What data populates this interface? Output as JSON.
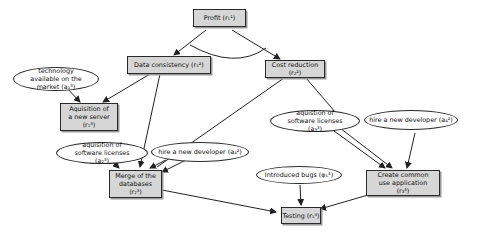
{
  "diagram": {
    "goals": {
      "profit": "Profit (r₁¹)",
      "data_consistency": "Data consistency (r₁²)",
      "cost_reduction": "Cost reduction (r₂²)",
      "new_server": "Aquisition of a new server (r₁³)",
      "merge_databases": "Merge of the databases (r₂³)",
      "common_app": "Create common use application (r₃³)",
      "testing": "Testing (r₁⁴)"
    },
    "conditions": {
      "technology": "technology available on the market (a₁³)",
      "licenses_left": "aquisition of software licenses (a₂³)",
      "developer_left": "hire a new developer (a₄²)",
      "licenses_right": "aquistion of software licenses (a₃³)",
      "developer_right": "hire a new developer (a₄²)",
      "bugs": "Introduced bugs (φ₁⁴)"
    },
    "edges": [
      {
        "from": "profit",
        "to": "data_consistency"
      },
      {
        "from": "profit",
        "to": "cost_reduction"
      },
      {
        "from": "data_consistency",
        "to": "new_server"
      },
      {
        "from": "data_consistency",
        "to": "merge_databases"
      },
      {
        "from": "technology",
        "to": "new_server"
      },
      {
        "from": "cost_reduction",
        "to": "merge_databases"
      },
      {
        "from": "cost_reduction",
        "to": "common_app"
      },
      {
        "from": "licenses_left",
        "to": "merge_databases"
      },
      {
        "from": "developer_left",
        "to": "merge_databases"
      },
      {
        "from": "licenses_right",
        "to": "common_app"
      },
      {
        "from": "developer_right",
        "to": "common_app"
      },
      {
        "from": "merge_databases",
        "to": "testing"
      },
      {
        "from": "common_app",
        "to": "testing"
      },
      {
        "from": "bugs",
        "to": "testing"
      }
    ],
    "and_arc": "profit decomposition (AND)"
  }
}
